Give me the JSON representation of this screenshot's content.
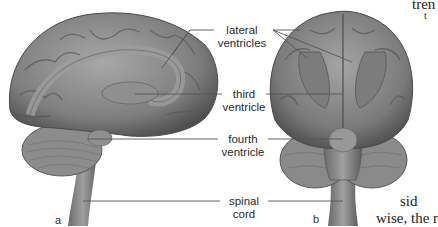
{
  "figure": {
    "panels": [
      {
        "id": "a",
        "letter": "a",
        "view": "lateral view"
      },
      {
        "id": "b",
        "letter": "b",
        "view": "posterior view"
      }
    ],
    "labels": {
      "lateral_ventricles": {
        "line1": "lateral",
        "line2": "ventricles"
      },
      "third_ventricle": {
        "line1": "third",
        "line2": "ventricle"
      },
      "fourth_ventricle": {
        "line1": "fourth",
        "line2": "ventricle"
      },
      "spinal_cord": {
        "line1": "spinal",
        "line2": "cord"
      }
    },
    "colors": {
      "background": "#ffffff",
      "brain_mid": "#8a8a8a",
      "brain_dark": "#555555",
      "brain_light": "#b8b8b8",
      "leader_line": "#555555",
      "label_text": "#2a2a2a"
    }
  },
  "page_text": {
    "top_right_fragment_1": "tren",
    "top_right_fragment_2": "t",
    "bottom_right_line_1": "sid",
    "bottom_right_line_2": "wise, the r"
  }
}
